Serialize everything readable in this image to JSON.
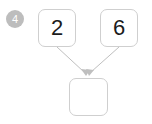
{
  "badge": {
    "label": "4",
    "shape": "circle",
    "background_color": "#bdbdbd",
    "text_color": "#ffffff"
  },
  "diagram": {
    "type": "tree",
    "background_color": "#ffffff",
    "node_border_color": "#cfcfcf",
    "node_fill_color": "#ffffff",
    "edge_color": "#bfbfbf",
    "nodes": [
      {
        "id": "operand-left",
        "label": "2",
        "position": "top-left",
        "empty": false
      },
      {
        "id": "operand-right",
        "label": "6",
        "position": "top-right",
        "empty": false
      },
      {
        "id": "result",
        "label": "",
        "position": "bottom-center",
        "empty": true
      }
    ],
    "edges": [
      {
        "from": "operand-left",
        "to": "result",
        "arrow": true
      },
      {
        "from": "operand-right",
        "to": "result",
        "arrow": true
      }
    ]
  }
}
